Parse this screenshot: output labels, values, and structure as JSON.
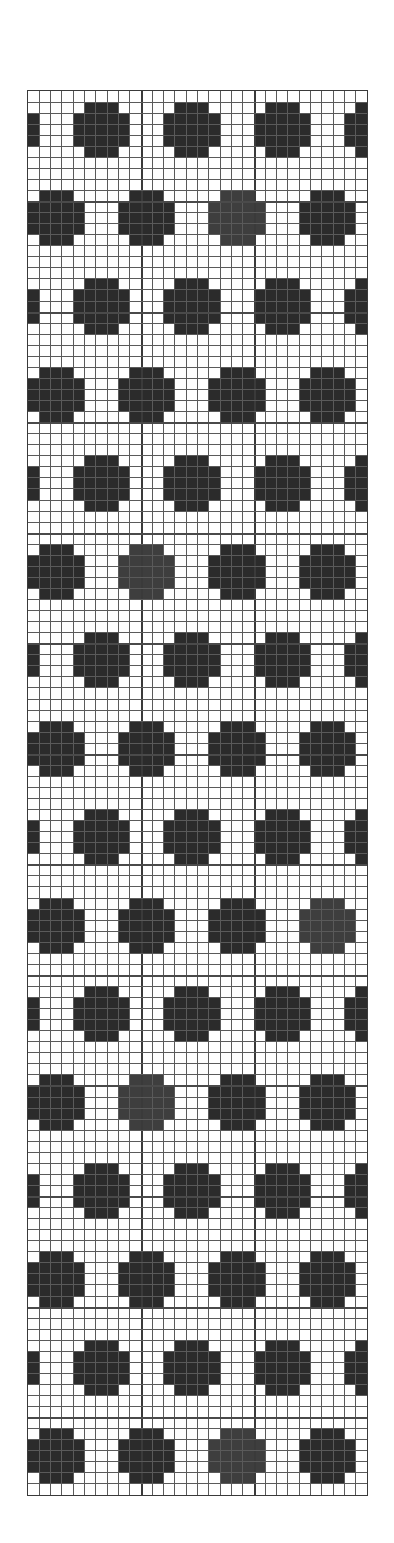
{
  "chart": {
    "title": "",
    "type": "colorwork-grid",
    "columns": 30,
    "rows": 127,
    "major_line_every": 10,
    "colors": {
      "background": "#ffffff",
      "grid_line": "#5a5a5a",
      "dark": "#2b2b2b",
      "mid": "#3e3e3e",
      "border": "#3a3a3a"
    },
    "motif": {
      "name": "dot",
      "shape_rows": [
        {
          "offset": -1,
          "half_width": 1
        },
        {
          "offset": 0,
          "half_width": 2
        },
        {
          "offset": 1,
          "half_width": 2
        },
        {
          "offset": 2,
          "half_width": 2
        },
        {
          "offset": 3,
          "half_width": 1
        }
      ],
      "horizontal_period": 8
    },
    "dot_rows": [
      {
        "center_row": 2,
        "first_center_col": 6,
        "lighter_dot_cols": []
      },
      {
        "center_row": 10,
        "first_center_col": 2,
        "lighter_dot_cols": [
          18
        ]
      },
      {
        "center_row": 18,
        "first_center_col": 6,
        "lighter_dot_cols": []
      },
      {
        "center_row": 26,
        "first_center_col": 2,
        "lighter_dot_cols": []
      },
      {
        "center_row": 34,
        "first_center_col": 6,
        "lighter_dot_cols": []
      },
      {
        "center_row": 42,
        "first_center_col": 2,
        "lighter_dot_cols": [
          10
        ]
      },
      {
        "center_row": 50,
        "first_center_col": 6,
        "lighter_dot_cols": []
      },
      {
        "center_row": 58,
        "first_center_col": 2,
        "lighter_dot_cols": []
      },
      {
        "center_row": 66,
        "first_center_col": 6,
        "lighter_dot_cols": []
      },
      {
        "center_row": 74,
        "first_center_col": 2,
        "lighter_dot_cols": [
          26
        ]
      },
      {
        "center_row": 82,
        "first_center_col": 6,
        "lighter_dot_cols": []
      },
      {
        "center_row": 90,
        "first_center_col": 2,
        "lighter_dot_cols": [
          10
        ]
      },
      {
        "center_row": 98,
        "first_center_col": 6,
        "lighter_dot_cols": []
      },
      {
        "center_row": 106,
        "first_center_col": 2,
        "lighter_dot_cols": []
      },
      {
        "center_row": 114,
        "first_center_col": 6,
        "lighter_dot_cols": []
      },
      {
        "center_row": 122,
        "first_center_col": 2,
        "lighter_dot_cols": [
          18
        ]
      }
    ]
  }
}
